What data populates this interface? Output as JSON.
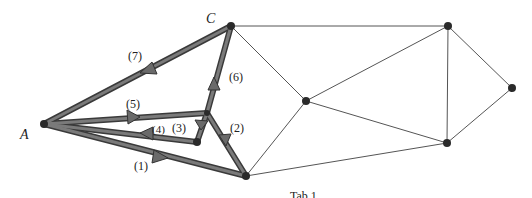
{
  "diagram": {
    "type": "graph-path",
    "node_labels": {
      "A": "A",
      "C": "C"
    },
    "step_labels": [
      "(1)",
      "(2)",
      "(3)",
      "(4)",
      "(5)",
      "(6)",
      "(7)"
    ],
    "caption_partial": "Tab 1",
    "nodes": [
      {
        "id": "A",
        "x": 44,
        "y": 124
      },
      {
        "id": "C",
        "x": 231,
        "y": 26
      },
      {
        "id": "M",
        "x": 207,
        "y": 113
      },
      {
        "id": "D",
        "x": 197,
        "y": 142
      },
      {
        "id": "B",
        "x": 246,
        "y": 176
      },
      {
        "id": "E",
        "x": 306,
        "y": 101
      },
      {
        "id": "F",
        "x": 448,
        "y": 26
      },
      {
        "id": "G",
        "x": 512,
        "y": 88
      },
      {
        "id": "H",
        "x": 447,
        "y": 143
      }
    ],
    "thin_edges": [
      [
        "C",
        "F"
      ],
      [
        "C",
        "E"
      ],
      [
        "B",
        "E"
      ],
      [
        "B",
        "H"
      ],
      [
        "E",
        "F"
      ],
      [
        "E",
        "H"
      ],
      [
        "F",
        "H"
      ],
      [
        "F",
        "G"
      ],
      [
        "H",
        "G"
      ]
    ],
    "path_edges": [
      {
        "step": "(1)",
        "from": "A",
        "to": "B"
      },
      {
        "step": "(2)",
        "from": "B",
        "to": "M"
      },
      {
        "step": "(3)",
        "from": "M",
        "to": "D"
      },
      {
        "step": "(4)",
        "from": "D",
        "to": "A"
      },
      {
        "step": "(5)",
        "from": "A",
        "to": "M"
      },
      {
        "step": "(6)",
        "from": "M",
        "to": "C"
      },
      {
        "step": "(7)",
        "from": "C",
        "to": "A"
      }
    ],
    "colors": {
      "path": "#6e6e6e",
      "path_edge": "#3a3a3a",
      "thin_edge": "#555555",
      "node": "#2a2a2a"
    }
  }
}
